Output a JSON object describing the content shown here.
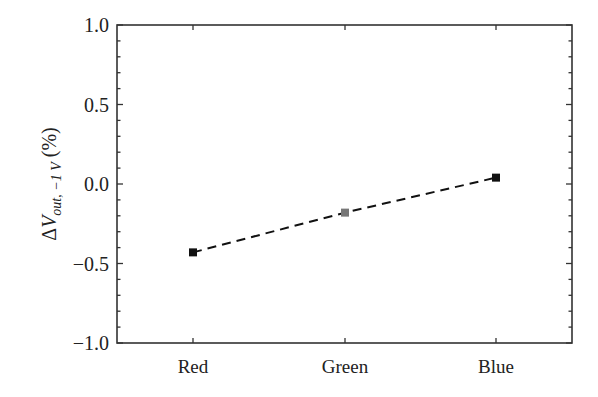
{
  "chart_data": {
    "type": "line",
    "title": "",
    "xlabel": "",
    "ylabel": "ΔV_out, −1 V (%)",
    "ylabel_parts": {
      "delta": "Δ",
      "var": "V",
      "subscript": "out, −1 V",
      "unit": " (%)"
    },
    "categories": [
      "Red",
      "Green",
      "Blue"
    ],
    "series": [
      {
        "name": "ΔV_out",
        "values": [
          -0.43,
          -0.18,
          0.04
        ],
        "marker_colors": [
          "#111111",
          "#777777",
          "#111111"
        ],
        "line_style": "dashed",
        "line_color": "#111111"
      }
    ],
    "ylim": [
      -1.0,
      1.0
    ],
    "yticks": [
      1.0,
      0.5,
      0.0,
      -0.5,
      -1.0
    ],
    "ytick_labels": [
      "1.0",
      "0.5",
      "0.0",
      "−0.5",
      "−1.0"
    ],
    "yminor_step": 0.1,
    "grid": false,
    "legend": null
  }
}
